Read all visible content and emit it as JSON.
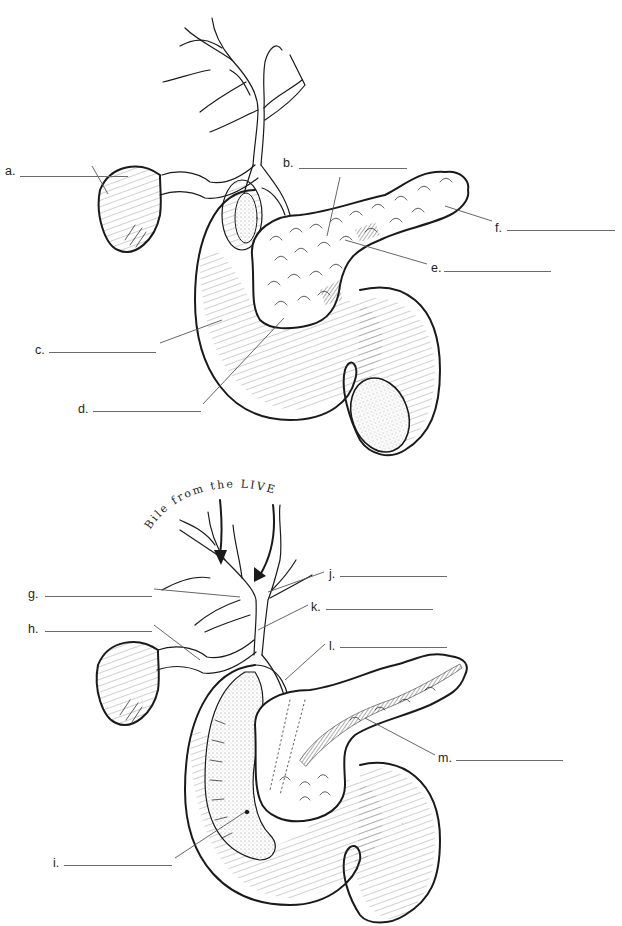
{
  "diagram_1": {
    "labels": [
      {
        "key": "a",
        "text": "a.",
        "x": 5,
        "y": 171,
        "blank_x": 20,
        "blank_w": 108
      },
      {
        "key": "b",
        "text": "b.",
        "x": 283,
        "y": 157,
        "blank_x": 299,
        "blank_w": 108
      },
      {
        "key": "f",
        "text": "f.",
        "x": 495,
        "y": 223,
        "blank_x": 507,
        "blank_w": 108
      },
      {
        "key": "e",
        "text": "e.",
        "x": 431,
        "y": 262,
        "blank_x": 444,
        "blank_w": 107
      },
      {
        "key": "c",
        "text": "c.",
        "x": 35,
        "y": 345,
        "blank_x": 49,
        "blank_w": 107
      },
      {
        "key": "d",
        "text": "d.",
        "x": 78,
        "y": 403,
        "blank_x": 93,
        "blank_w": 108
      }
    ]
  },
  "diagram_2": {
    "caption": "Bile from the LIVER",
    "labels": [
      {
        "key": "j",
        "text": "j.",
        "x": 329,
        "y": 569,
        "blank_x": 340,
        "blank_w": 107
      },
      {
        "key": "g",
        "text": "g.",
        "x": 28,
        "y": 589,
        "blank_x": 45,
        "blank_w": 107
      },
      {
        "key": "k",
        "text": "k.",
        "x": 311,
        "y": 601,
        "blank_x": 326,
        "blank_w": 107
      },
      {
        "key": "h",
        "text": "h.",
        "x": 28,
        "y": 624,
        "blank_x": 45,
        "blank_w": 107
      },
      {
        "key": "l",
        "text": "l.",
        "x": 329,
        "y": 640,
        "blank_x": 340,
        "blank_w": 107
      },
      {
        "key": "m",
        "text": "m.",
        "x": 438,
        "y": 752,
        "blank_x": 456,
        "blank_w": 107
      },
      {
        "key": "i",
        "text": "i.",
        "x": 53,
        "y": 857,
        "blank_x": 64,
        "blank_w": 108
      }
    ]
  }
}
